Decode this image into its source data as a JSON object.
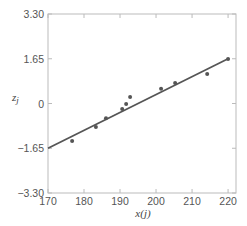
{
  "chart_data": {
    "type": "scatter",
    "title": "",
    "xlabel": "x(j)",
    "ylabel": "z_j",
    "ylabel_main": "z",
    "ylabel_sub": "j",
    "xlim": [
      170,
      222.2
    ],
    "ylim": [
      -3.3,
      3.3
    ],
    "x_ticks": [
      170,
      180,
      190,
      200,
      210,
      220
    ],
    "x_tick_labels": [
      "170",
      "180",
      "190",
      "200",
      "210",
      "220"
    ],
    "y_ticks": [
      3.3,
      1.65,
      0,
      -1.65,
      -3.3
    ],
    "y_tick_labels": [
      "3.30",
      "1.65",
      "0",
      "−1.65",
      "−3.30"
    ],
    "grid": false,
    "legend": null,
    "series": [
      {
        "name": "observations",
        "type": "scatter",
        "color": "#555555",
        "points": [
          {
            "x": 176.7,
            "y": -1.38
          },
          {
            "x": 183.3,
            "y": -0.87
          },
          {
            "x": 186.1,
            "y": -0.54
          },
          {
            "x": 190.6,
            "y": -0.2
          },
          {
            "x": 191.7,
            "y": -0.02
          },
          {
            "x": 192.8,
            "y": 0.24
          },
          {
            "x": 201.4,
            "y": 0.54
          },
          {
            "x": 205.3,
            "y": 0.76
          },
          {
            "x": 214.2,
            "y": 1.09
          },
          {
            "x": 220.0,
            "y": 1.64
          }
        ]
      },
      {
        "name": "fitted line",
        "type": "line",
        "color": "#555555",
        "points": [
          {
            "x": 170,
            "y": -1.65
          },
          {
            "x": 220,
            "y": 1.65
          }
        ]
      }
    ]
  },
  "layout": {
    "plot_left": 48,
    "plot_right": 236,
    "plot_top": 14,
    "plot_bottom": 193,
    "frame_color": "#bbbbbb",
    "line_color": "#555555",
    "point_color": "#555555"
  }
}
